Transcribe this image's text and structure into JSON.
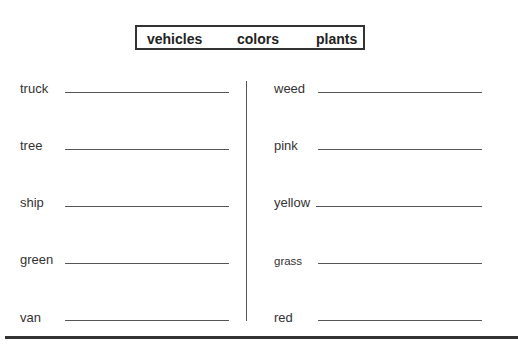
{
  "header": {
    "categories": [
      "vehicles",
      "colors",
      "plants"
    ]
  },
  "left_column": [
    {
      "word": "truck"
    },
    {
      "word": "tree"
    },
    {
      "word": "ship"
    },
    {
      "word": "green"
    },
    {
      "word": "van"
    }
  ],
  "right_column": [
    {
      "word": "weed"
    },
    {
      "word": "pink"
    },
    {
      "word": "yellow"
    },
    {
      "word": "grass"
    },
    {
      "word": "red"
    }
  ]
}
